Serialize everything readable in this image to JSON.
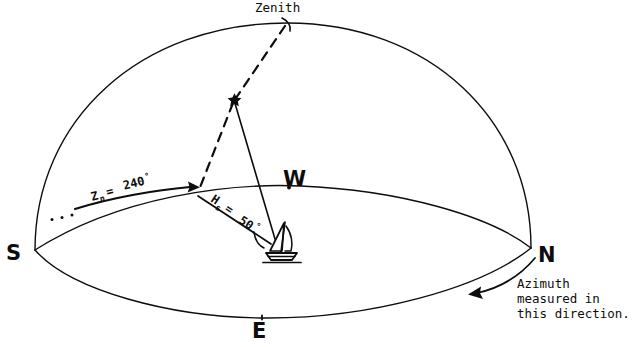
{
  "diagram": {
    "background_color": "#ffffff",
    "ink_color": "#0d0d0d",
    "cardinal_points": [
      {
        "id": "south",
        "label": "S"
      },
      {
        "id": "west",
        "label": "W"
      },
      {
        "id": "north",
        "label": "N"
      },
      {
        "id": "east",
        "label": "E"
      }
    ],
    "zenith": {
      "label": "Zenith"
    },
    "azimuth": {
      "symbol": "Z",
      "subscript": "n",
      "equals": " = ",
      "value": "240",
      "degree": "°",
      "full_label": "Zn = 240°"
    },
    "altitude": {
      "symbol": "H",
      "subscript": "s",
      "equals": " = ",
      "value": "50",
      "degree": "°",
      "full_label": "Hs = 50°"
    },
    "direction_note": {
      "line1": "Azimuth",
      "line2": "measured in",
      "line3": "this direction."
    },
    "body": {
      "name": "star-marker"
    },
    "observer": {
      "name": "sailboat"
    }
  }
}
